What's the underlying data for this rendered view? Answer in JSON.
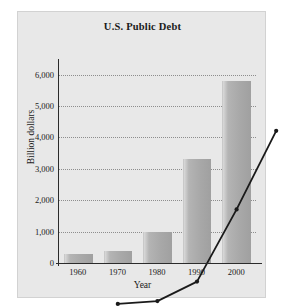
{
  "chart_data": {
    "type": "bar",
    "title": "U.S. Public Debt",
    "xlabel": "Year",
    "ylabel": "Billion dollars",
    "categories": [
      "1960",
      "1970",
      "1980",
      "1990",
      "2000"
    ],
    "values": [
      290,
      380,
      1000,
      3300,
      5800
    ],
    "series": [
      {
        "name": "U.S. Public Debt",
        "type": "bar",
        "values": [
          290,
          380,
          1000,
          3300,
          5800
        ]
      },
      {
        "name": "Trend line",
        "type": "line",
        "values": [
          290,
          380,
          1000,
          3300,
          5800
        ]
      }
    ],
    "ylim": [
      0,
      6400
    ],
    "yticks": [
      0,
      1000,
      2000,
      3000,
      4000,
      5000,
      6000
    ],
    "ytick_labels": [
      "0",
      "1,000",
      "2,000",
      "3,000",
      "4,000",
      "5,000",
      "6,000"
    ],
    "grid": true,
    "grid_style": "dotted-horizontal",
    "legend": "none",
    "units": "Billion dollars",
    "zero_label": "0"
  },
  "colors": {
    "panel_background": "#e8e8e8",
    "figure_background": "#ffffff",
    "bar_fill": "#a8a8a8",
    "bar_highlight": "#d9d9d9",
    "line": "#1a1a1a",
    "marker": "#1a1a1a",
    "axis": "#2b2b2b",
    "gridline": "#8d8d8d",
    "text": "#1a1a1a"
  }
}
